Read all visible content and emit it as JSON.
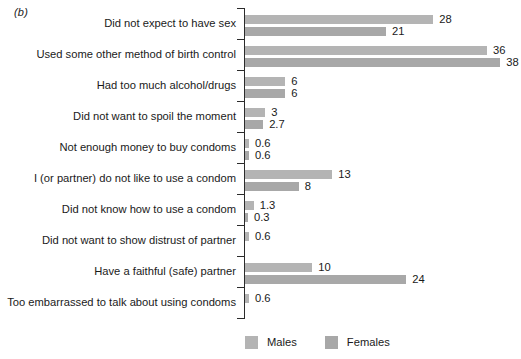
{
  "panel": {
    "tag": "(b)"
  },
  "legend": {
    "position": "bottom-left",
    "items": [
      {
        "key": "males",
        "label": "Males",
        "color": "#b4b4b4"
      },
      {
        "key": "females",
        "label": "Females",
        "color": "#a8a8a8"
      }
    ]
  },
  "chart_data": {
    "type": "bar",
    "orientation": "horizontal",
    "title": "",
    "subtitle": "",
    "xlabel": "",
    "ylabel": "",
    "grid": false,
    "legend_position": "bottom-left",
    "xlim": [
      0,
      41
    ],
    "categories": [
      "Did not expect to have sex",
      "Used some other method of birth control",
      "Had too much alcohol/drugs",
      "Did not want to spoil the moment",
      "Not enough money to buy condoms",
      "I (or partner) do not like to use a condom",
      "Did not know how to use a condom",
      "Did not want to show distrust of partner",
      "Have a faithful (safe) partner",
      "Too embarrassed to talk about using condoms"
    ],
    "series": [
      {
        "name": "Males",
        "color": "#b4b4b4",
        "values": [
          28,
          36,
          6,
          3,
          0.6,
          13,
          1.3,
          0.6,
          10,
          0.6
        ],
        "labels": [
          "28",
          "36",
          "6",
          "3",
          "0.6",
          "13",
          "1.3",
          "0.6",
          "10",
          "0.6"
        ]
      },
      {
        "name": "Females",
        "color": "#a8a8a8",
        "values": [
          21,
          38,
          6,
          2.7,
          0.6,
          8,
          0.3,
          null,
          24,
          null
        ],
        "labels": [
          "21",
          "38",
          "6",
          "2.7",
          "0.6",
          "8",
          "0.3",
          "",
          "24",
          ""
        ]
      }
    ]
  }
}
